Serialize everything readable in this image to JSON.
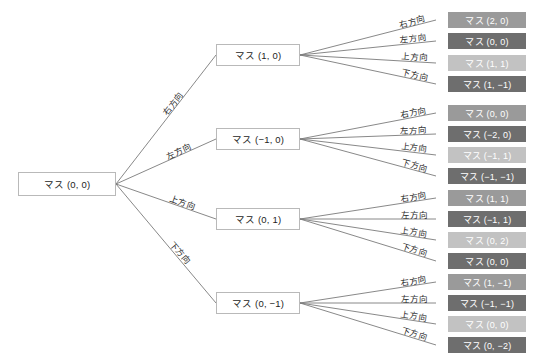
{
  "diagram": {
    "type": "search-tree",
    "title": "",
    "root": {
      "label": "マス (0, 0)"
    },
    "direction_labels": {
      "right": "右方向",
      "left": "左方向",
      "up": "上方向",
      "down": "下方向"
    },
    "colors": {
      "leaf_shade_1": "#9a9a9a",
      "leaf_shade_2": "#6e6e6e",
      "leaf_shade_3": "#c2c2c2",
      "leaf_shade_4": "#6e6e6e",
      "node_border": "#b9b9b9",
      "node_fill": "#ffffff",
      "edge": "#7b7b7b",
      "text_dark": "#1d1d1d",
      "text_light": "#ffffff",
      "background": "#ffffff"
    },
    "branches": [
      {
        "edge_label": "右方向",
        "node": {
          "label": "マス (1, 0)"
        },
        "leaves": [
          {
            "edge_label": "右方向",
            "label": "マス (2, 0)",
            "shade": "#9a9a9a"
          },
          {
            "edge_label": "左方向",
            "label": "マス (0, 0)",
            "shade": "#6e6e6e"
          },
          {
            "edge_label": "上方向",
            "label": "マス (1, 1)",
            "shade": "#c2c2c2"
          },
          {
            "edge_label": "下方向",
            "label": "マス (1, −1)",
            "shade": "#6e6e6e"
          }
        ]
      },
      {
        "edge_label": "左方向",
        "node": {
          "label": "マス (−1, 0)"
        },
        "leaves": [
          {
            "edge_label": "右方向",
            "label": "マス (0, 0)",
            "shade": "#9a9a9a"
          },
          {
            "edge_label": "左方向",
            "label": "マス (−2, 0)",
            "shade": "#6e6e6e"
          },
          {
            "edge_label": "上方向",
            "label": "マス (−1, 1)",
            "shade": "#c2c2c2"
          },
          {
            "edge_label": "下方向",
            "label": "マス (−1, −1)",
            "shade": "#6e6e6e"
          }
        ]
      },
      {
        "edge_label": "上方向",
        "node": {
          "label": "マス (0, 1)"
        },
        "leaves": [
          {
            "edge_label": "右方向",
            "label": "マス (1, 1)",
            "shade": "#9a9a9a"
          },
          {
            "edge_label": "左方向",
            "label": "マス (−1, 1)",
            "shade": "#6e6e6e"
          },
          {
            "edge_label": "上方向",
            "label": "マス (0, 2)",
            "shade": "#c2c2c2"
          },
          {
            "edge_label": "下方向",
            "label": "マス (0, 0)",
            "shade": "#6e6e6e"
          }
        ]
      },
      {
        "edge_label": "下方向",
        "node": {
          "label": "マス (0, −1)"
        },
        "leaves": [
          {
            "edge_label": "右方向",
            "label": "マス (1, −1)",
            "shade": "#9a9a9a"
          },
          {
            "edge_label": "左方向",
            "label": "マス (−1, −1)",
            "shade": "#6e6e6e"
          },
          {
            "edge_label": "上方向",
            "label": "マス (0, 0)",
            "shade": "#c2c2c2"
          },
          {
            "edge_label": "下方向",
            "label": "マス (0, −2)",
            "shade": "#6e6e6e"
          }
        ]
      }
    ]
  }
}
